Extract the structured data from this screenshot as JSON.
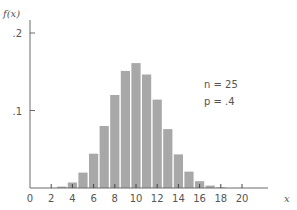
{
  "chart_data": {
    "type": "bar",
    "title": "",
    "xlabel": "x",
    "ylabel": "f(x)",
    "xlim": [
      0,
      24
    ],
    "ylim": [
      0,
      0.2
    ],
    "x_ticks": [
      0,
      2,
      4,
      6,
      8,
      10,
      12,
      14,
      16,
      18,
      20
    ],
    "x_tick_labels": [
      "0",
      "2",
      "4",
      "6",
      "8",
      "10",
      "12",
      "14",
      "16",
      "18",
      "20"
    ],
    "y_ticks": [
      0.1,
      0.2
    ],
    "y_tick_labels": [
      ".1",
      ".2"
    ],
    "grid": false,
    "categories": [
      3,
      4,
      5,
      6,
      7,
      8,
      9,
      10,
      11,
      12,
      13,
      14,
      15,
      16,
      17,
      18
    ],
    "values": [
      0.0018,
      0.0071,
      0.0199,
      0.0442,
      0.08,
      0.12,
      0.1511,
      0.1612,
      0.1465,
      0.114,
      0.076,
      0.0434,
      0.0212,
      0.0088,
      0.0031,
      0.0009
    ],
    "annotations": [
      "n = 25",
      "p = .4"
    ],
    "bar_color": "#a8a8a8",
    "axis_color": "#6a6a6a"
  },
  "labels": {
    "y_axis": "f(x)",
    "x_axis": "x",
    "n_label": "n = 25",
    "p_label": "p = .4"
  }
}
